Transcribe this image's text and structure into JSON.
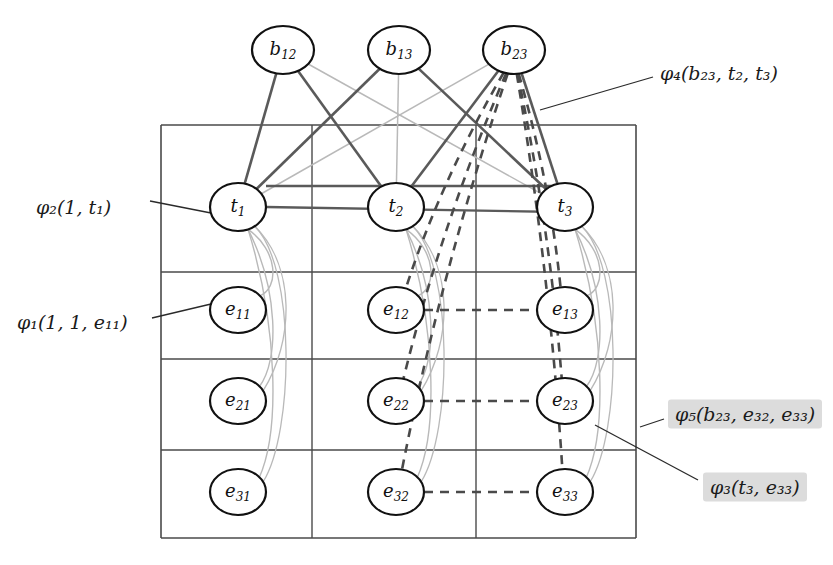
{
  "figure": {
    "type": "factor-graph-diagram",
    "background": "#ffffff",
    "width": 833,
    "height": 565
  },
  "palette": {
    "node_stroke": "#111111",
    "node_fill": "#ffffff",
    "grid_stroke": "#4a4a4a",
    "factor_edge_dark": "#5a5a5a",
    "factor_edge_light": "#b9b9b9",
    "dashed_edge": "#4a4a4a",
    "leader_line": "#2a2a2a",
    "highlight_bg": "#dcdcdc",
    "text": "#1a1a1a"
  },
  "nodes": {
    "b_row": [
      {
        "id": "b12",
        "base": "b",
        "sub": "12",
        "cx": 283,
        "cy": 50,
        "rx": 31,
        "ry": 24
      },
      {
        "id": "b13",
        "base": "b",
        "sub": "13",
        "cx": 399,
        "cy": 50,
        "rx": 31,
        "ry": 24
      },
      {
        "id": "b23",
        "base": "b",
        "sub": "23",
        "cx": 514,
        "cy": 50,
        "rx": 31,
        "ry": 24
      }
    ],
    "t_row": [
      {
        "id": "t1",
        "base": "t",
        "sub": "1",
        "cx": 238,
        "cy": 207,
        "rx": 28,
        "ry": 24
      },
      {
        "id": "t2",
        "base": "t",
        "sub": "2",
        "cx": 396,
        "cy": 207,
        "rx": 28,
        "ry": 24
      },
      {
        "id": "t3",
        "base": "t",
        "sub": "3",
        "cx": 565,
        "cy": 207,
        "rx": 28,
        "ry": 24
      }
    ],
    "e_rows": [
      [
        {
          "id": "e11",
          "base": "e",
          "sub": "11",
          "cx": 238,
          "cy": 310,
          "rx": 28,
          "ry": 23
        },
        {
          "id": "e12",
          "base": "e",
          "sub": "12",
          "cx": 396,
          "cy": 310,
          "rx": 28,
          "ry": 23
        },
        {
          "id": "e13",
          "base": "e",
          "sub": "13",
          "cx": 565,
          "cy": 310,
          "rx": 28,
          "ry": 23
        }
      ],
      [
        {
          "id": "e21",
          "base": "e",
          "sub": "21",
          "cx": 238,
          "cy": 401,
          "rx": 28,
          "ry": 23
        },
        {
          "id": "e22",
          "base": "e",
          "sub": "22",
          "cx": 396,
          "cy": 401,
          "rx": 28,
          "ry": 23
        },
        {
          "id": "e23",
          "base": "e",
          "sub": "23",
          "cx": 565,
          "cy": 401,
          "rx": 28,
          "ry": 23
        }
      ],
      [
        {
          "id": "e31",
          "base": "e",
          "sub": "31",
          "cx": 238,
          "cy": 492,
          "rx": 28,
          "ry": 23
        },
        {
          "id": "e32",
          "base": "e",
          "sub": "32",
          "cx": 396,
          "cy": 492,
          "rx": 28,
          "ry": 23
        },
        {
          "id": "e33",
          "base": "e",
          "sub": "33",
          "cx": 565,
          "cy": 492,
          "rx": 28,
          "ry": 23
        }
      ]
    ]
  },
  "grid": {
    "left": 161,
    "right": 636,
    "top": 125,
    "bottom": 538,
    "col_dividers": [
      312,
      476
    ],
    "row_dividers": [
      272,
      359,
      450
    ]
  },
  "annotations": [
    {
      "id": "phi4",
      "text": "φ₄(b₂₃, t₂, t₃)",
      "phi": "φ",
      "index": "4",
      "args": "(b23, t2, t3)",
      "x": 660,
      "y": 73,
      "highlight": false,
      "leader": {
        "x1": 653,
        "y1": 77,
        "x2": 540,
        "y2": 110
      }
    },
    {
      "id": "phi2",
      "text": "φ₂(1, t₁)",
      "phi": "φ",
      "index": "2",
      "args": "(1, t1)",
      "x": 36,
      "y": 207,
      "highlight": false,
      "leader": {
        "x1": 150,
        "y1": 201,
        "x2": 211,
        "y2": 213
      }
    },
    {
      "id": "phi1",
      "text": "φ₁(1, 1, e₁₁)",
      "phi": "φ",
      "index": "1",
      "args": "(1, 1, e11)",
      "x": 17,
      "y": 322,
      "highlight": false,
      "leader": {
        "x1": 152,
        "y1": 318,
        "x2": 211,
        "y2": 304
      }
    },
    {
      "id": "phi5",
      "text": "φ₅(b₂₃, e₃₂, e₃₃)",
      "phi": "φ",
      "index": "5",
      "args": "(b23, e32, e33)",
      "x": 668,
      "y": 414,
      "highlight": true,
      "leader": {
        "x1": 664,
        "y1": 419,
        "x2": 640,
        "y2": 427
      }
    },
    {
      "id": "phi3",
      "text": "φ₃(t₃, e₃₃)",
      "phi": "φ",
      "index": "3",
      "args": "(t3, e33)",
      "x": 703,
      "y": 487,
      "highlight": true,
      "leader": {
        "x1": 698,
        "y1": 480,
        "x2": 595,
        "y2": 425
      }
    }
  ],
  "edges": {
    "b_to_t_dark": [
      {
        "from": "b12",
        "to": "t1"
      },
      {
        "from": "b12",
        "to": "t2"
      },
      {
        "from": "b13",
        "to": "t1"
      },
      {
        "from": "b13",
        "to": "t3"
      },
      {
        "from": "b23",
        "to": "t2"
      },
      {
        "from": "b23",
        "to": "t3"
      }
    ],
    "b_to_t_light": [
      {
        "from": "b12",
        "to": "t3"
      },
      {
        "from": "b13",
        "to": "t2"
      },
      {
        "from": "b23",
        "to": "t1"
      }
    ],
    "t_to_e_light": [
      {
        "from": "t1",
        "to": "e11"
      },
      {
        "from": "t1",
        "to": "e21"
      },
      {
        "from": "t1",
        "to": "e31"
      },
      {
        "from": "t2",
        "to": "e12"
      },
      {
        "from": "t2",
        "to": "e22"
      },
      {
        "from": "t2",
        "to": "e32"
      },
      {
        "from": "t3",
        "to": "e13"
      },
      {
        "from": "t3",
        "to": "e23"
      },
      {
        "from": "t3",
        "to": "e33"
      }
    ],
    "b23_dashed": [
      {
        "from": "b23",
        "to": "e12"
      },
      {
        "from": "b23",
        "to": "e13"
      },
      {
        "from": "b23",
        "to": "e22"
      },
      {
        "from": "b23",
        "to": "e23"
      },
      {
        "from": "b23",
        "to": "e32"
      },
      {
        "from": "b23",
        "to": "e33"
      }
    ],
    "dashed_pairs": [
      {
        "from": "e12",
        "to": "e13"
      },
      {
        "from": "e22",
        "to": "e23"
      },
      {
        "from": "e32",
        "to": "e33"
      }
    ]
  }
}
